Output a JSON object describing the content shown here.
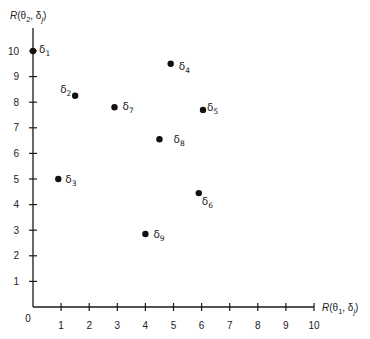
{
  "chart_data": {
    "type": "scatter",
    "title": "",
    "xlabel": "R(θ1, δj)",
    "ylabel": "R(θ2, δj)",
    "xlim": [
      0,
      10
    ],
    "ylim": [
      0,
      10
    ],
    "grid": false,
    "legend": null,
    "x_ticks": [
      1,
      2,
      3,
      4,
      5,
      6,
      7,
      8,
      9,
      10
    ],
    "y_ticks": [
      1,
      2,
      3,
      4,
      5,
      6,
      7,
      8,
      9,
      10
    ],
    "origin_label": "0",
    "points": [
      {
        "label": "δ",
        "sub": "1",
        "x": 0.0,
        "y": 10.0,
        "label_dx": 6,
        "label_dy": 2
      },
      {
        "label": "δ",
        "sub": "2",
        "x": 1.5,
        "y": 8.25,
        "label_dx": -15,
        "label_dy": -3
      },
      {
        "label": "δ",
        "sub": "3",
        "x": 0.9,
        "y": 5.0,
        "label_dx": 7,
        "label_dy": 4
      },
      {
        "label": "δ",
        "sub": "4",
        "x": 4.9,
        "y": 9.5,
        "label_dx": 8,
        "label_dy": 6
      },
      {
        "label": "δ",
        "sub": "5",
        "x": 6.05,
        "y": 7.7,
        "label_dx": 4,
        "label_dy": 1
      },
      {
        "label": "δ",
        "sub": "6",
        "x": 5.9,
        "y": 4.45,
        "label_dx": 3,
        "label_dy": 12
      },
      {
        "label": "δ",
        "sub": "7",
        "x": 2.9,
        "y": 7.8,
        "label_dx": 8,
        "label_dy": 3
      },
      {
        "label": "δ",
        "sub": "8",
        "x": 4.5,
        "y": 6.55,
        "label_dx": 14,
        "label_dy": 4
      },
      {
        "label": "δ",
        "sub": "9",
        "x": 4.0,
        "y": 2.85,
        "label_dx": 8,
        "label_dy": 4
      }
    ]
  },
  "axes": {
    "x_title_main": "R",
    "x_title_rest": "(θ",
    "x_title_sub1": "1",
    "x_title_mid": ", δ",
    "x_title_sub2": "j",
    "x_title_end": ")",
    "y_title_main": "R",
    "y_title_rest": "(θ",
    "y_title_sub1": "2",
    "y_title_mid": ", δ",
    "y_title_sub2": "j",
    "y_title_end": ")"
  },
  "colors": {
    "axis": "#1a1a1a",
    "point": "#111111",
    "text": "#222222",
    "background": "#ffffff"
  }
}
